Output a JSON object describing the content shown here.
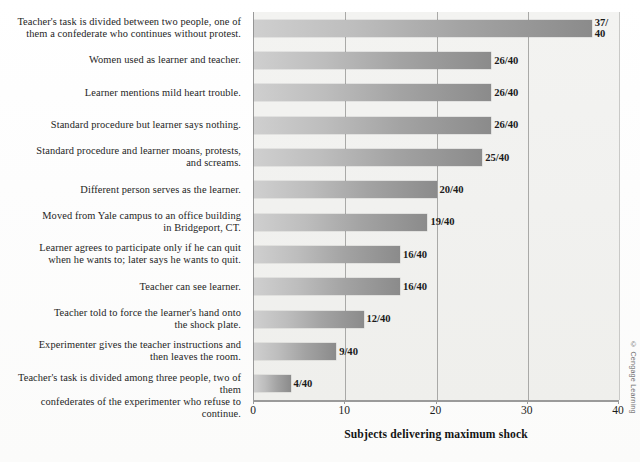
{
  "chart_data": {
    "type": "bar",
    "orientation": "horizontal",
    "title": "",
    "xlabel": "Subjects delivering maximum shock",
    "ylabel": "",
    "xlim": [
      0,
      40
    ],
    "xticks": [
      "0",
      "10",
      "20",
      "30",
      "40"
    ],
    "grid": true,
    "gridlines_at": [
      10,
      20,
      30
    ],
    "legend": "none",
    "denominator": 40,
    "categories": [
      "Teacher's task is divided between two people, one of\nthem a confederate who continues without protest.",
      "Women used as learner and teacher.",
      "Learner mentions mild heart trouble.",
      "Standard procedure but learner says nothing.",
      "Standard procedure and learner moans, protests,\nand screams.",
      "Different person serves as the learner.",
      "Moved from Yale campus to an office building\nin Bridgeport, CT.",
      "Learner agrees to participate only if he can quit\nwhen he wants to; later says he wants to quit.",
      "Teacher can see learner.",
      "Teacher told to force the learner's hand onto\nthe shock plate.",
      "Experimenter gives the teacher instructions and\nthen leaves the room.",
      "Teacher's task is divided among three people, two of them\nconfederates of the experimenter who refuse to continue."
    ],
    "values": [
      37,
      26,
      26,
      26,
      25,
      20,
      19,
      16,
      16,
      12,
      9,
      4
    ],
    "data_labels": [
      "37/\n40",
      "26/40",
      "26/40",
      "26/40",
      "25/40",
      "20/40",
      "19/40",
      "16/40",
      "16/40",
      "12/40",
      "9/40",
      "4/40"
    ],
    "bar_color_start": "#cfcfcf",
    "bar_color_end": "#8b8b8b",
    "plot_background": "#f1f1ef",
    "axis_color": "#9a9a9a"
  },
  "credit": "© Cengage Learning"
}
